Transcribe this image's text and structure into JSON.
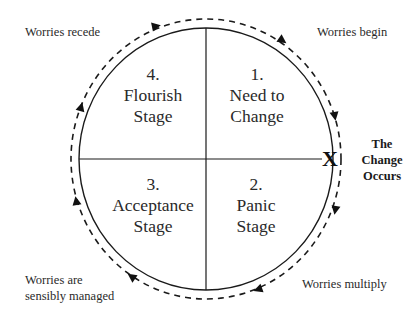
{
  "diagram": {
    "type": "cycle",
    "quadrants": [
      {
        "number": "1.",
        "line1": "Need to",
        "line2": "Change",
        "position": "top-right"
      },
      {
        "number": "2.",
        "line1": "Panic",
        "line2": "Stage",
        "position": "bottom-right"
      },
      {
        "number": "3.",
        "line1": "Acceptance",
        "line2": "Stage",
        "position": "bottom-left"
      },
      {
        "number": "4.",
        "line1": "Flourish",
        "line2": "Stage",
        "position": "top-left"
      }
    ],
    "outer_labels": {
      "top_left": "Worries recede",
      "top_right": "Worries begin",
      "bottom_right": "Worries multiply",
      "bottom_left_line1": "Worries are",
      "bottom_left_line2": "sensibly managed"
    },
    "event": {
      "marker": "X",
      "line1": "The",
      "line2": "Change",
      "line3": "Occurs"
    },
    "direction": "clockwise",
    "colors": {
      "stroke": "#1a1a1a",
      "text": "#2a2a2a",
      "background": "#ffffff"
    }
  }
}
